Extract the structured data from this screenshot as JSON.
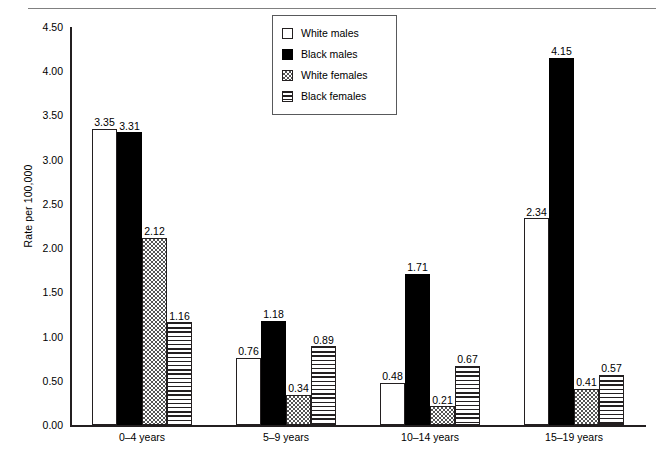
{
  "chart_data": {
    "type": "bar",
    "title": "",
    "xlabel": "",
    "ylabel": "Rate per 100,000",
    "ylim": [
      0,
      4.5
    ],
    "ytick_labels": [
      "4.50",
      "4.00",
      "3.50",
      "3.00",
      "2.50",
      "2.00",
      "1.50",
      "1.00",
      "0.50",
      "0.00"
    ],
    "ytick_values": [
      4.5,
      4.0,
      3.5,
      3.0,
      2.5,
      2.0,
      1.5,
      1.0,
      0.5,
      0.0
    ],
    "grid": false,
    "legend_position": "top-center",
    "categories": [
      "0–4 years",
      "5–9 years",
      "10–14 years",
      "15–19 years"
    ],
    "series": [
      {
        "name": "White males",
        "pattern": "open",
        "values": [
          3.35,
          3.31,
          2.12,
          1.16
        ]
      },
      {
        "name": "Black males",
        "pattern": "solid-black",
        "values": [
          0.76,
          1.18,
          0.34,
          0.89
        ]
      },
      {
        "name": "White females",
        "pattern": "checkered",
        "values": [
          0.48,
          1.71,
          0.21,
          0.67
        ]
      },
      {
        "name": "Black females",
        "pattern": "horizontal-lines",
        "values": [
          2.34,
          4.15,
          0.41,
          0.57
        ]
      }
    ],
    "groups": [
      {
        "category": "0–4 years",
        "bars": [
          {
            "series": "White males",
            "pattern": "open",
            "value": 3.35,
            "label": "3.35"
          },
          {
            "series": "Black males",
            "pattern": "solid-black",
            "value": 3.31,
            "label": "3.31"
          },
          {
            "series": "White females",
            "pattern": "checkered",
            "value": 2.12,
            "label": "2.12"
          },
          {
            "series": "Black females",
            "pattern": "horizontal-lines",
            "value": 1.16,
            "label": "1.16"
          }
        ]
      },
      {
        "category": "5–9 years",
        "bars": [
          {
            "series": "White males",
            "pattern": "open",
            "value": 0.76,
            "label": "0.76"
          },
          {
            "series": "Black males",
            "pattern": "solid-black",
            "value": 1.18,
            "label": "1.18"
          },
          {
            "series": "White females",
            "pattern": "checkered",
            "value": 0.34,
            "label": "0.34"
          },
          {
            "series": "Black females",
            "pattern": "horizontal-lines",
            "value": 0.89,
            "label": "0.89"
          }
        ]
      },
      {
        "category": "10–14 years",
        "bars": [
          {
            "series": "White males",
            "pattern": "open",
            "value": 0.48,
            "label": "0.48"
          },
          {
            "series": "Black males",
            "pattern": "solid-black",
            "value": 1.71,
            "label": "1.71"
          },
          {
            "series": "White females",
            "pattern": "checkered",
            "value": 0.21,
            "label": "0.21"
          },
          {
            "series": "Black females",
            "pattern": "horizontal-lines",
            "value": 0.67,
            "label": "0.67"
          }
        ]
      },
      {
        "category": "15–19 years",
        "bars": [
          {
            "series": "White males",
            "pattern": "open",
            "value": 2.34,
            "label": "2.34"
          },
          {
            "series": "Black males",
            "pattern": "solid-black",
            "value": 4.15,
            "label": "4.15"
          },
          {
            "series": "White females",
            "pattern": "checkered",
            "value": 0.41,
            "label": "0.41"
          },
          {
            "series": "Black females",
            "pattern": "horizontal-lines",
            "value": 0.57,
            "label": "0.57"
          }
        ]
      }
    ],
    "legend": [
      {
        "label": "White males",
        "pattern": "open"
      },
      {
        "label": "Black males",
        "pattern": "solid-black"
      },
      {
        "label": "White females",
        "pattern": "checkered"
      },
      {
        "label": "Black females",
        "pattern": "horizontal-lines"
      }
    ],
    "colors": {
      "axis": "#231f20",
      "bar_outline": "#231f20",
      "black_fill": "#000000",
      "white_fill": "#ffffff",
      "legend_border": "#58595b",
      "top_rule": "#808080"
    }
  }
}
